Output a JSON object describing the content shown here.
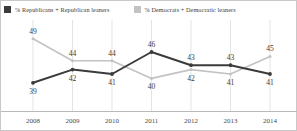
{
  "legend": {
    "republican": {
      "label": "% Republicans + Republican leaners",
      "swatch_icon": "square-swatch-icon",
      "color": "#3b3b3b"
    },
    "democrat": {
      "label": "% Democrats + Democratic leaners",
      "swatch_icon": "square-swatch-icon",
      "color": "#c3c3c3"
    }
  },
  "chart_data": {
    "type": "line",
    "title": "",
    "xlabel": "",
    "ylabel": "",
    "categories": [
      "2008",
      "2009",
      "2010",
      "2011",
      "2012",
      "2013",
      "2014"
    ],
    "ylim": [
      36,
      51
    ],
    "grid": true,
    "legend_position": "top",
    "series": [
      {
        "name": "% Republicans + Republican leaners",
        "color": "#3b3b3b",
        "values": [
          39,
          42,
          41,
          46,
          43,
          43,
          41
        ],
        "label_positions": [
          "below",
          "below",
          "below",
          "above",
          "above",
          "above",
          "below"
        ]
      },
      {
        "name": "% Democrats + Democratic leaners",
        "color": "#c3c3c3",
        "values": [
          49,
          44,
          44,
          40,
          42,
          41,
          45
        ],
        "label_positions": [
          "above",
          "above",
          "above",
          "below",
          "below",
          "below",
          "above"
        ]
      }
    ]
  }
}
